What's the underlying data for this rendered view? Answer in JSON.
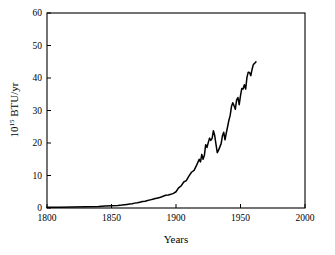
{
  "chart_data": {
    "type": "line",
    "title": "",
    "xlabel": "Years",
    "ylabel": "10^15 BTU/yr",
    "ylabel_mantissa": "10",
    "ylabel_exponent": "15",
    "ylabel_unit": " BTU/yr",
    "xlim": [
      1800,
      2000
    ],
    "ylim": [
      0,
      60
    ],
    "xticks": [
      1800,
      1850,
      1900,
      1950,
      2000
    ],
    "xtick_labels": [
      "1800",
      "1850",
      "1900",
      "1950",
      "2000"
    ],
    "yticks": [
      0,
      10,
      20,
      30,
      40,
      50,
      60
    ],
    "ytick_labels": [
      "0",
      "10",
      "20",
      "30",
      "40",
      "50",
      "60"
    ],
    "grid": false,
    "legend": "none",
    "line_color": "#000000",
    "background_color": "#ffffff",
    "series": [
      {
        "name": "Energy consumption",
        "x": [
          1800,
          1810,
          1820,
          1830,
          1840,
          1845,
          1850,
          1855,
          1858,
          1860,
          1862,
          1864,
          1866,
          1868,
          1870,
          1872,
          1874,
          1876,
          1878,
          1880,
          1882,
          1884,
          1886,
          1888,
          1890,
          1892,
          1894,
          1896,
          1898,
          1900,
          1902,
          1904,
          1906,
          1908,
          1910,
          1912,
          1914,
          1916,
          1918,
          1919,
          1920,
          1921,
          1922,
          1923,
          1924,
          1925,
          1926,
          1927,
          1928,
          1929,
          1930,
          1931,
          1932,
          1933,
          1934,
          1935,
          1936,
          1937,
          1938,
          1939,
          1940,
          1941,
          1942,
          1943,
          1944,
          1945,
          1946,
          1947,
          1948,
          1949,
          1950,
          1951,
          1952,
          1953,
          1954,
          1955,
          1956,
          1957,
          1958,
          1959,
          1960,
          1961,
          1962
        ],
        "y": [
          0.2,
          0.25,
          0.3,
          0.4,
          0.5,
          0.6,
          0.7,
          0.8,
          0.9,
          1.0,
          1.1,
          1.2,
          1.3,
          1.5,
          1.6,
          1.8,
          2.0,
          2.1,
          2.3,
          2.5,
          2.7,
          2.9,
          3.1,
          3.3,
          3.6,
          3.9,
          4.0,
          4.2,
          4.5,
          5.0,
          6.2,
          6.8,
          8.0,
          8.4,
          9.8,
          11.0,
          11.6,
          13.2,
          15.0,
          14.2,
          16.5,
          15.0,
          16.2,
          19.5,
          18.6,
          20.1,
          21.5,
          20.8,
          21.4,
          23.8,
          22.3,
          19.6,
          17.0,
          17.8,
          18.8,
          19.8,
          22.2,
          23.3,
          21.0,
          23.1,
          25.0,
          27.0,
          28.5,
          31.2,
          32.4,
          31.5,
          30.4,
          33.3,
          34.0,
          31.8,
          34.6,
          36.8,
          36.6,
          37.9,
          36.6,
          40.2,
          41.8,
          41.7,
          40.7,
          42.7,
          44.2,
          44.5,
          45.0
        ]
      }
    ]
  },
  "axes": {
    "x_title": "Years",
    "y_title_parts": {
      "base": "10",
      "exp": "15",
      "rest": " BTU/yr"
    }
  }
}
